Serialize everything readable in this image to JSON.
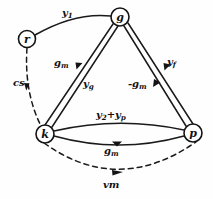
{
  "diagram": {
    "type": "node-edge-graph",
    "background_color": "#fefefe",
    "line_color": "#1a1a1a",
    "nodes": [
      {
        "id": "r",
        "label": "r",
        "x": 27,
        "y": 39,
        "radius": 8.5
      },
      {
        "id": "g",
        "label": "g",
        "x": 120,
        "y": 17,
        "radius": 9.0
      },
      {
        "id": "k",
        "label": "k",
        "x": 45,
        "y": 134,
        "radius": 9.0
      },
      {
        "id": "p",
        "label": "p",
        "x": 193,
        "y": 133,
        "radius": 9.0
      }
    ],
    "edges": [
      {
        "id": "r-g",
        "from": "r",
        "to": "g",
        "style": "solid",
        "label": "y1",
        "label_html": "y<sub>1</sub>"
      },
      {
        "id": "r-k",
        "from": "r",
        "to": "k",
        "style": "dashed",
        "label": "cs",
        "label_html": "cs"
      },
      {
        "id": "g-k-outer",
        "from": "g",
        "to": "k",
        "style": "solid",
        "label": "gm",
        "label_html": "g<sub>m</sub>"
      },
      {
        "id": "g-k-inner",
        "from": "g",
        "to": "k",
        "style": "solid",
        "label": "yg",
        "label_html": "y<sub>g</sub>"
      },
      {
        "id": "g-p-inner",
        "from": "g",
        "to": "p",
        "style": "solid",
        "label": "-gm",
        "label_html": "-g<sub>m</sub>"
      },
      {
        "id": "g-p-outer",
        "from": "g",
        "to": "p",
        "style": "solid",
        "label": "yf",
        "label_html": "y<sub>f</sub>"
      },
      {
        "id": "k-p-upper",
        "from": "k",
        "to": "p",
        "style": "solid",
        "label": "y2+yp",
        "label_html": "y<sub>2</sub>+y<sub>p</sub>"
      },
      {
        "id": "k-p-lower",
        "from": "k",
        "to": "p",
        "style": "solid",
        "label": "gm",
        "label_html": "g<sub>m</sub>"
      },
      {
        "id": "k-p-arc",
        "from": "k",
        "to": "p",
        "style": "dashed",
        "label": "vm",
        "label_html": "vm"
      }
    ]
  }
}
